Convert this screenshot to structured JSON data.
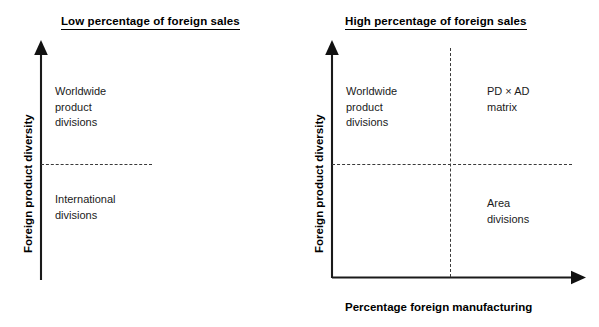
{
  "figure": {
    "panels": [
      {
        "id": "low-foreign-sales",
        "title": "Low percentage of foreign sales",
        "y_axis_label": "Foreign product diversity",
        "x_axis_label": "",
        "quadrants": [
          {
            "id": "upper",
            "lines": [
              "Worldwide",
              "product",
              "divisions"
            ]
          },
          {
            "id": "lower",
            "lines": [
              "International",
              "divisions"
            ]
          }
        ]
      },
      {
        "id": "high-foreign-sales",
        "title": "High percentage of foreign sales",
        "y_axis_label": "Foreign product diversity",
        "x_axis_label": "Percentage foreign manufacturing",
        "quadrants": [
          {
            "id": "upper-left",
            "lines": [
              "Worldwide",
              "product",
              "divisions"
            ]
          },
          {
            "id": "upper-right",
            "lines": [
              "PD × AD",
              "matrix"
            ]
          },
          {
            "id": "lower-right",
            "lines": [
              "Area",
              "divisions"
            ]
          },
          {
            "id": "lower-left",
            "lines": []
          }
        ]
      }
    ],
    "colors": {
      "axis": "#1a1a1a",
      "dashed_divider": "#3a3a3a",
      "text": "#000000",
      "quadrant_text": "#1a1a1a",
      "background": "#ffffff"
    }
  }
}
